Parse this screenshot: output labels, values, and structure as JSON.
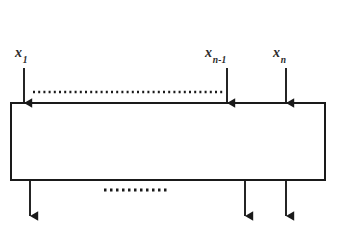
{
  "figure": {
    "type": "block-diagram",
    "background_color": "#ffffff",
    "stroke_color": "#1a1a1a",
    "block": {
      "name": "processing-block",
      "x": 11,
      "y": 103,
      "width": 314,
      "height": 77,
      "fill": "#ffffff",
      "stroke_width": 2
    },
    "input_labels": [
      {
        "base": "x",
        "sub": "1",
        "text": "x1",
        "x": 24
      },
      {
        "base": "x",
        "sub": "n-1",
        "text": "xn-1",
        "x": 227
      },
      {
        "base": "x",
        "sub": "n",
        "text": "xn",
        "x": 286
      }
    ],
    "input_arrows": [
      {
        "name": "input-arrow-x1",
        "x": 24,
        "y_start": 68,
        "y_end": 103
      },
      {
        "name": "input-arrow-xn-1",
        "x": 227,
        "y_start": 68,
        "y_end": 103
      },
      {
        "name": "input-arrow-xn",
        "x": 286,
        "y_start": 68,
        "y_end": 103
      }
    ],
    "output_arrows": [
      {
        "name": "output-arrow-1",
        "x": 30,
        "y_start": 180,
        "y_end": 216
      },
      {
        "name": "output-arrow-n-1",
        "x": 245,
        "y_start": 180,
        "y_end": 216
      },
      {
        "name": "output-arrow-n",
        "x": 286,
        "y_start": 180,
        "y_end": 216
      }
    ],
    "ellipsis_lines": [
      {
        "name": "top-ellipsis",
        "x_start": 33,
        "x_end": 224,
        "y": 92,
        "dash": "2 3.2"
      },
      {
        "name": "bottom-ellipsis",
        "x_start": 104,
        "x_end": 170,
        "y": 190,
        "dash": "2.5 3.5"
      }
    ]
  }
}
